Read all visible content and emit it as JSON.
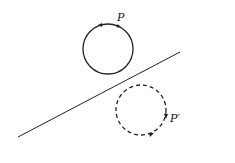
{
  "diagram": {
    "labels": {
      "point": "P",
      "image_point": "P′"
    },
    "colors": {
      "stroke": "#222222",
      "background": "#ffffff"
    },
    "elements": {
      "solid_circle": {
        "cx": 108,
        "cy": 49,
        "r": 25,
        "style": "solid"
      },
      "dashed_circle": {
        "cx": 141,
        "cy": 110,
        "r": 25,
        "style": "dashed"
      },
      "mirror_line": {
        "x1": 18,
        "y1": 137,
        "x2": 180,
        "y2": 52
      }
    }
  }
}
